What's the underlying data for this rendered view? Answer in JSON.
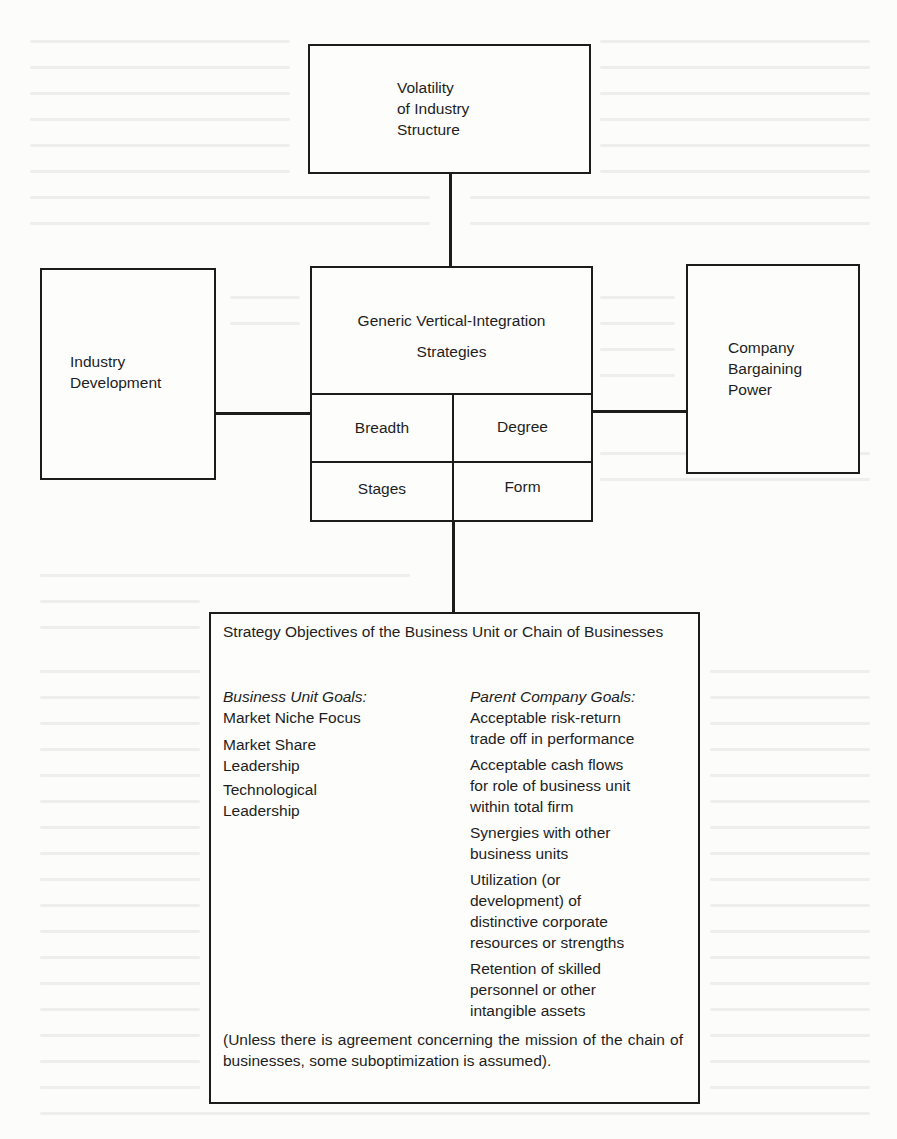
{
  "diagram": {
    "top_box": {
      "text": "Volatility\nof Industry\nStructure"
    },
    "left_box": {
      "text": "Industry\nDevelopment"
    },
    "right_box": {
      "text": "Company\nBargaining\nPower"
    },
    "center_box": {
      "title_line1": "Generic Vertical-Integration",
      "title_line2": "Strategies",
      "cells": [
        {
          "label": "Breadth"
        },
        {
          "label": "Degree"
        },
        {
          "label": "Stages"
        },
        {
          "label": "Form"
        }
      ]
    },
    "bottom_box": {
      "title": "Strategy Objectives of the Business Unit or Chain of Businesses",
      "business_unit": {
        "heading": "Business Unit Goals:",
        "items": [
          "Market Niche Focus",
          "Market Share\nLeadership",
          "Technological\nLeadership"
        ]
      },
      "parent_company": {
        "heading": "Parent Company Goals:",
        "items": [
          "Acceptable risk-return\ntrade off in performance",
          "Acceptable cash flows\nfor role of business unit\nwithin total firm",
          "Synergies with other\nbusiness units",
          "Utilization (or\ndevelopment) of\ndistinctive corporate\nresources or strengths",
          "Retention of skilled\npersonnel or other\nintangible assets"
        ]
      },
      "footnote": "(Unless there is agreement concerning the mission of the chain of businesses, some suboptimization is assumed)."
    },
    "colors": {
      "ink": "#1c1c1c",
      "paper": "#fcfcfb"
    }
  }
}
